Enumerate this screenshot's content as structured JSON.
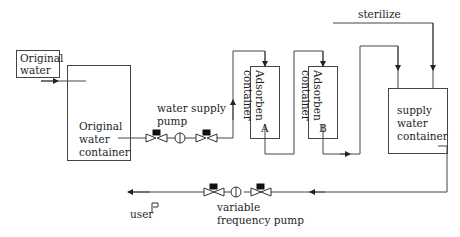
{
  "diagram": {
    "nodes": {
      "original_water": {
        "line1": "Original",
        "line2": "water"
      },
      "original_container": {
        "line1": "Original",
        "line2": "water",
        "line3": "container"
      },
      "water_supply_pump": {
        "line1": "water supply",
        "line2": "pump"
      },
      "adsorben_a": {
        "line1": "Adsorben",
        "line2": "container",
        "tag": "A"
      },
      "adsorben_b": {
        "line1": "Adsorben",
        "line2": "container",
        "tag": "B"
      },
      "sterilize": {
        "label": "sterilize"
      },
      "supply_container": {
        "line1": "supply",
        "line2": "water",
        "line3": "container"
      },
      "variable_pump": {
        "line1": "variable",
        "line2": "frequency pump"
      },
      "user": {
        "label": "user"
      }
    },
    "edges": [
      {
        "from": "original_water",
        "to": "original_container"
      },
      {
        "from": "original_container",
        "to": "water_supply_pump"
      },
      {
        "from": "water_supply_pump",
        "to": "adsorben_a"
      },
      {
        "from": "adsorben_a",
        "to": "adsorben_b"
      },
      {
        "from": "adsorben_b",
        "to": "supply_container"
      },
      {
        "from": "sterilize",
        "to": "supply_container"
      },
      {
        "from": "supply_container",
        "to": "variable_pump"
      },
      {
        "from": "variable_pump",
        "to": "user"
      }
    ],
    "colors": {
      "line": "#444444",
      "text": "#1e1e1e"
    }
  }
}
